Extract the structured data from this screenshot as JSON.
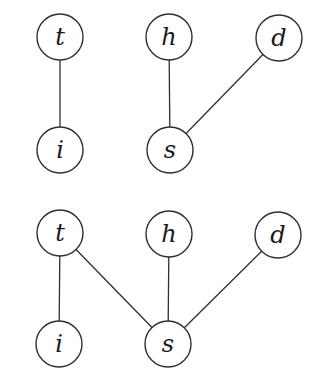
{
  "diagram": {
    "type": "graph-pair",
    "style": {
      "line_color": "#2f2f2f",
      "node_fill": "#ffffff",
      "label_color": "#1a1a1a",
      "background": "#ffffff",
      "node_radius": 23
    },
    "graphs": [
      {
        "name": "top-graph",
        "nodes": [
          {
            "id": "t",
            "label": "t",
            "x": 60,
            "y": 37
          },
          {
            "id": "h",
            "label": "h",
            "x": 169,
            "y": 37
          },
          {
            "id": "d",
            "label": "d",
            "x": 279,
            "y": 38
          },
          {
            "id": "i",
            "label": "i",
            "x": 60,
            "y": 150
          },
          {
            "id": "s",
            "label": "s",
            "x": 170,
            "y": 150
          }
        ],
        "edges": [
          {
            "from": "t",
            "to": "i"
          },
          {
            "from": "h",
            "to": "s"
          },
          {
            "from": "d",
            "to": "s"
          }
        ]
      },
      {
        "name": "bottom-graph",
        "nodes": [
          {
            "id": "t",
            "label": "t",
            "x": 60,
            "y": 233
          },
          {
            "id": "h",
            "label": "h",
            "x": 169,
            "y": 234
          },
          {
            "id": "d",
            "label": "d",
            "x": 278,
            "y": 235
          },
          {
            "id": "i",
            "label": "i",
            "x": 59,
            "y": 344
          },
          {
            "id": "s",
            "label": "s",
            "x": 168,
            "y": 344
          }
        ],
        "edges": [
          {
            "from": "t",
            "to": "i"
          },
          {
            "from": "t",
            "to": "s"
          },
          {
            "from": "h",
            "to": "s"
          },
          {
            "from": "d",
            "to": "s"
          }
        ]
      }
    ]
  }
}
